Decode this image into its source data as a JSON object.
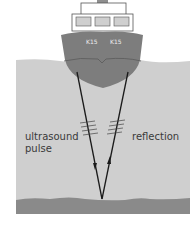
{
  "diagram": {
    "ship": {
      "hull_labels": [
        "K15",
        "K15"
      ]
    },
    "labels": {
      "pulse_line1": "ultrasound",
      "pulse_line2": "pulse",
      "reflection": "reflection"
    },
    "colors": {
      "water": "#cfcfcf",
      "hull": "#7d7d7d",
      "seabed": "#8a8a8a",
      "ship_top": "#ffffff",
      "lines": "#1a1a1a"
    }
  }
}
